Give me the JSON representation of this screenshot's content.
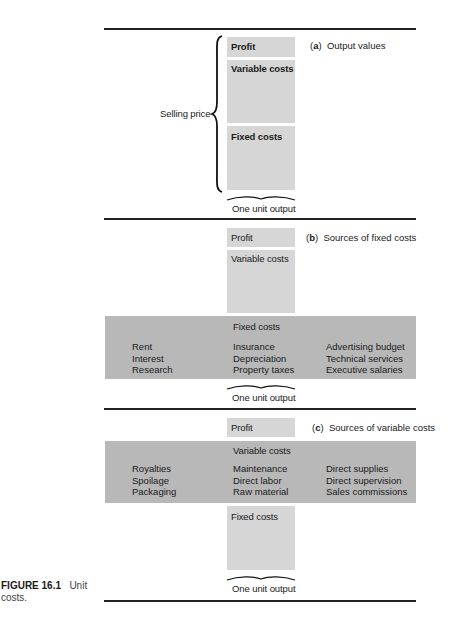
{
  "figure": {
    "number": "FIGURE 16.1",
    "caption": "Unit costs."
  },
  "panel_a": {
    "title_letter": "a",
    "title_text": "Output values",
    "brace_label": "Selling price",
    "boxes": {
      "profit": "Profit",
      "variable": "Variable costs",
      "fixed": "Fixed costs"
    },
    "bottom_label": "One unit output"
  },
  "panel_b": {
    "title_letter": "b",
    "title_text": "Sources of fixed costs",
    "boxes": {
      "profit": "Profit",
      "variable": "Variable costs",
      "fixed": "Fixed costs"
    },
    "sources": [
      [
        "Rent",
        "Interest",
        "Research"
      ],
      [
        "Insurance",
        "Depreciation",
        "Property taxes"
      ],
      [
        "Advertising budget",
        "Technical services",
        "Executive salaries"
      ]
    ],
    "bottom_label": "One unit output"
  },
  "panel_c": {
    "title_letter": "c",
    "title_text": "Sources of variable costs",
    "boxes": {
      "profit": "Profit",
      "variable": "Variable costs",
      "fixed": "Fixed costs"
    },
    "sources": [
      [
        "Royalties",
        "Spoilage",
        "Packaging"
      ],
      [
        "Maintenance",
        "Direct labor",
        "Raw material"
      ],
      [
        "Direct supplies",
        "Direct supervision",
        "Sales commissions"
      ]
    ],
    "bottom_label": "One unit output"
  },
  "colors": {
    "light_box": "#d6d6d6",
    "dark_band": "#b8b8b8",
    "rule": "#222222"
  }
}
